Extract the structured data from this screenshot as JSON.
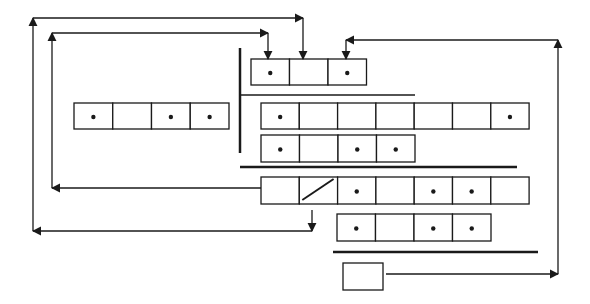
{
  "diagram": {
    "type": "linked-record-structure",
    "stroke_color": "#1a1a1a",
    "background": "#ffffff",
    "records": [
      {
        "id": "top-record",
        "x": 251,
        "y": 59,
        "cell_w": 38.5,
        "h": 26,
        "cells": [
          true,
          false,
          true
        ],
        "slash_cell": -1
      },
      {
        "id": "left-record",
        "x": 74,
        "y": 103,
        "cell_w": 38.75,
        "h": 26,
        "cells": [
          true,
          false,
          true,
          true
        ],
        "slash_cell": -1
      },
      {
        "id": "row2-record",
        "x": 261,
        "y": 103,
        "cell_w": 38.3,
        "h": 26,
        "cells": [
          true,
          false,
          false,
          false,
          false,
          false,
          true
        ],
        "slash_cell": -1
      },
      {
        "id": "row3-record",
        "x": 261,
        "y": 135,
        "cell_w": 38.5,
        "h": 27,
        "cells": [
          true,
          false,
          true,
          true
        ],
        "slash_cell": -1
      },
      {
        "id": "row4-record",
        "x": 261,
        "y": 177,
        "cell_w": 38.3,
        "h": 27,
        "cells": [
          false,
          false,
          true,
          false,
          true,
          true,
          false
        ],
        "slash_cell": 1
      },
      {
        "id": "row5-record",
        "x": 337,
        "y": 214,
        "cell_w": 38.5,
        "h": 27,
        "cells": [
          true,
          false,
          true,
          true
        ],
        "slash_cell": -1
      },
      {
        "id": "single-box",
        "x": 343,
        "y": 263,
        "cell_w": 40,
        "h": 27,
        "cells": [
          false
        ],
        "slash_cell": -1
      }
    ],
    "separators": [
      {
        "id": "vertical-divider",
        "x1": 240,
        "y1": 48,
        "x2": 240,
        "y2": 153,
        "width": 2.5
      },
      {
        "id": "thin-divider-top",
        "x1": 240,
        "y1": 95,
        "x2": 415,
        "y2": 95,
        "width": 1.3
      },
      {
        "id": "thick-divider-middle",
        "x1": 240,
        "y1": 167,
        "x2": 517,
        "y2": 167,
        "width": 2.5
      },
      {
        "id": "thick-divider-bottom",
        "x1": 333,
        "y1": 252,
        "x2": 538,
        "y2": 252,
        "width": 2.5
      }
    ],
    "arrows": [
      {
        "id": "outer-left-loop-arrow",
        "points": [
          [
            312,
            231
          ],
          [
            33,
            231
          ],
          [
            33,
            18
          ],
          [
            303,
            18
          ],
          [
            303,
            59
          ]
        ],
        "heads": [
          "start-left",
          "corner-up",
          "corner-right",
          "end-down"
        ]
      },
      {
        "id": "inner-left-loop-arrow",
        "points": [
          [
            261,
            188
          ],
          [
            52,
            188
          ],
          [
            52,
            33
          ],
          [
            268,
            33
          ],
          [
            268,
            59
          ]
        ],
        "heads": [
          "left",
          "up",
          "right",
          "down"
        ]
      },
      {
        "id": "right-loop-arrow",
        "points": [
          [
            386,
            274
          ],
          [
            558,
            274
          ],
          [
            558,
            40
          ],
          [
            346,
            40
          ],
          [
            346,
            59
          ]
        ],
        "heads": [
          "right",
          "up",
          "left",
          "down"
        ]
      },
      {
        "id": "down-arrow-from-slash",
        "points": [
          [
            312,
            210
          ],
          [
            312,
            231
          ]
        ],
        "heads": [
          "down"
        ]
      }
    ]
  }
}
